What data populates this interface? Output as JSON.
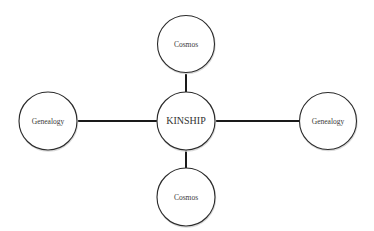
{
  "diagram": {
    "type": "hub-and-spoke",
    "center": {
      "label": "KINSHIP"
    },
    "nodes": {
      "top": {
        "label": "Cosmos"
      },
      "bottom": {
        "label": "Cosmos"
      },
      "left": {
        "label": "Genealogy"
      },
      "right": {
        "label": "Genealogy"
      }
    },
    "edges": [
      {
        "from": "center",
        "to": "top"
      },
      {
        "from": "center",
        "to": "bottom"
      },
      {
        "from": "center",
        "to": "left"
      },
      {
        "from": "center",
        "to": "right"
      }
    ]
  }
}
